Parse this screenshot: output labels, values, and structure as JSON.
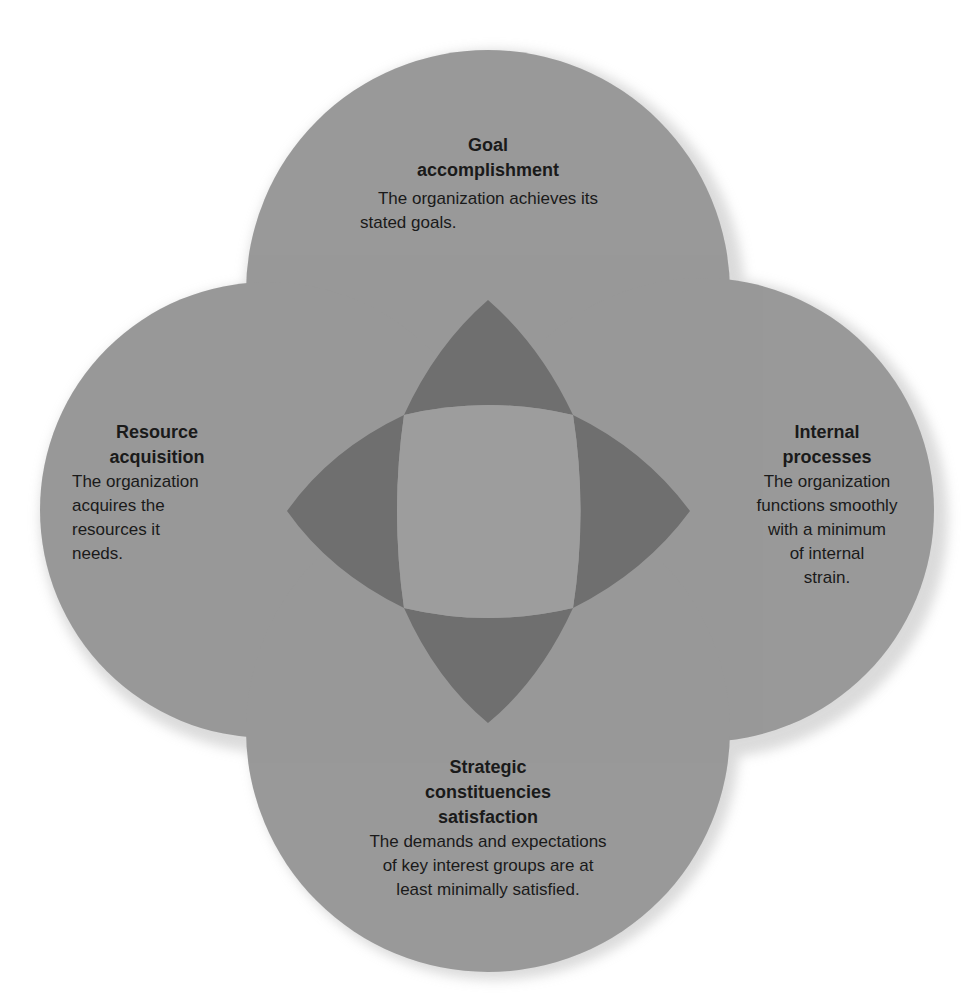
{
  "diagram": {
    "type": "four-circle overlapping diagram (effectiveness approaches)",
    "colors": {
      "circle": "#a3a3a3",
      "circle_overlap": "#999999",
      "petal": "#6e6e6e",
      "center": "#9d9d9d",
      "shadow": "#c8c8c8",
      "text": "#1a1a1a"
    },
    "circles": [
      {
        "id": "top",
        "title": "Goal accomplishment",
        "title_lines": [
          "Goal",
          "accomplishment"
        ],
        "description": "The organization achieves its stated goals.",
        "desc_lines": [
          "The organization achieves its",
          "stated goals."
        ]
      },
      {
        "id": "left",
        "title": "Resource acquisition",
        "title_lines": [
          "Resource",
          "acquisition"
        ],
        "description": "The organization acquires the resources it needs.",
        "desc_lines": [
          "The organization",
          "acquires the",
          "resources it",
          "needs."
        ]
      },
      {
        "id": "right",
        "title": "Internal processes",
        "title_lines": [
          "Internal",
          "processes"
        ],
        "description": "The organization functions smoothly with a minimum of internal strain.",
        "desc_lines": [
          "The organization",
          "functions smoothly",
          "with a minimum",
          "of internal",
          "strain."
        ]
      },
      {
        "id": "bottom",
        "title": "Strategic constituencies satisfaction",
        "title_lines": [
          "Strategic",
          "constituencies",
          "satisfaction"
        ],
        "description": "The demands and expectations of key interest groups are at least minimally satisfied.",
        "desc_lines": [
          "The demands and expectations",
          "of key interest groups are at",
          "least minimally satisfied."
        ]
      }
    ]
  }
}
